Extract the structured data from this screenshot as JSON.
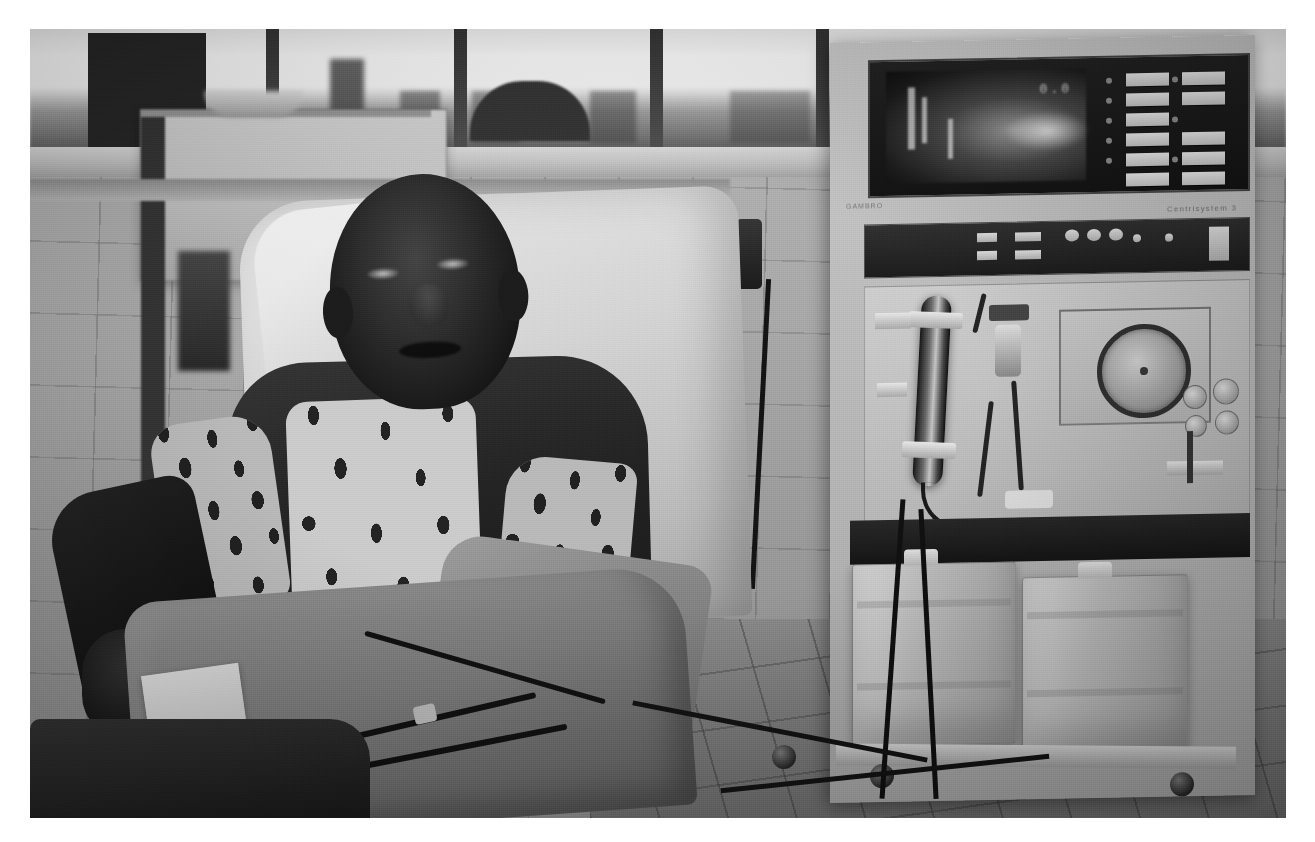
{
  "image": {
    "kind": "photograph",
    "medium": "black-and-white photographic print",
    "caption": "A man sits in a reclining treatment chair receiving haemodialysis beside a freestanding dialysis machine in a tiled clinic room with a window overlooking a city skyline.",
    "border_color": "#ffffff",
    "tone_light": "#e9e8e4",
    "tone_mid": "#8d8d8d",
    "tone_dark": "#141312"
  },
  "scene": {
    "room": {
      "name": "dialysis treatment room",
      "wall_finish": "square ceramic wall tiles",
      "floor_finish": "square floor tiles with dark grout"
    },
    "window": {
      "name": "window",
      "view": "overexposed sky with distant low skyline and a domed building silhouette"
    },
    "patient": {
      "name": "patient",
      "posture": "seated, reclined, facing the camera",
      "clothing_outer": "dark jacket",
      "clothing_inner": "patterned light shirt",
      "lap_covering": "folded blanket",
      "dressing": "white gauze pad over vascular access site"
    },
    "chair": {
      "name": "treatment chair",
      "covering": "white sheet / pillow"
    }
  },
  "machine": {
    "name": "hemodialysis machine",
    "brand_label": "Centrisystem 3",
    "side_label": "GAMBRO",
    "monitor": {
      "name": "monitor display",
      "reading": "0.0",
      "state": "illuminated CRT screen"
    },
    "keypad": {
      "name": "membrane keypad",
      "left_column_count": 6,
      "right_column_count": 5
    },
    "components": [
      {
        "name": "dialyzer cartridge"
      },
      {
        "name": "peristaltic blood pump"
      },
      {
        "name": "venous drip chamber"
      },
      {
        "name": "pressure monitor knobs"
      },
      {
        "name": "blood tubing set"
      }
    ],
    "containers": {
      "name": "concentrate containers",
      "count": 2,
      "description": "two translucent plastic jerrycans on the machine base"
    },
    "base": {
      "name": "rolling base",
      "casters": 2
    }
  },
  "background_equipment": {
    "name": "wall-mounted monitoring module",
    "description": "rack unit with dark vertical slots and indicator lamps on the left wall"
  }
}
